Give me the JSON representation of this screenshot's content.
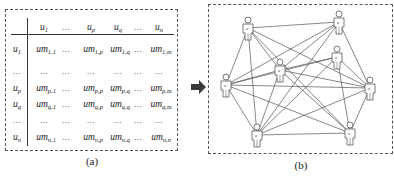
{
  "panel_a": {
    "caption": "(a)",
    "header": [
      {
        "base": "u",
        "sub": "1",
        "x": 44
      },
      {
        "dots": "…",
        "x": 66
      },
      {
        "base": "u",
        "sub": "p",
        "x": 91
      },
      {
        "base": "u",
        "sub": "q",
        "x": 118
      },
      {
        "dots": "…",
        "x": 138
      },
      {
        "base": "u",
        "sub": "n",
        "x": 159
      }
    ],
    "rows": [
      {
        "label": {
          "base": "u",
          "sub": "1"
        },
        "y": 49,
        "cells": [
          {
            "base": "um",
            "sub": "1,1"
          },
          {
            "dots": "…"
          },
          {
            "base": "um",
            "sub": "1,p"
          },
          {
            "base": "um",
            "sub": "1,q"
          },
          {
            "dots": "…"
          },
          {
            "base": "um",
            "sub": "1,m"
          }
        ]
      },
      {
        "label": {
          "dots": "…"
        },
        "y": 71,
        "cells": [
          {
            "dots": "…"
          },
          {
            "dots": "…"
          },
          {
            "dots": "…"
          },
          {
            "dots": "…"
          },
          {
            "dots": "…"
          },
          {
            "dots": "…"
          }
        ]
      },
      {
        "label": {
          "base": "u",
          "sub": "p"
        },
        "y": 88,
        "cells": [
          {
            "base": "um",
            "sub": "p,1"
          },
          {
            "dots": "…"
          },
          {
            "base": "um",
            "sub": "p,p"
          },
          {
            "base": "um",
            "sub": "p,q"
          },
          {
            "dots": "…"
          },
          {
            "base": "um",
            "sub": "p,m"
          }
        ]
      },
      {
        "label": {
          "base": "u",
          "sub": "q"
        },
        "y": 104,
        "cells": [
          {
            "base": "um",
            "sub": "q,1"
          },
          {
            "dots": "…"
          },
          {
            "base": "um",
            "sub": "q,p"
          },
          {
            "base": "um",
            "sub": "q,q"
          },
          {
            "dots": "…"
          },
          {
            "base": "um",
            "sub": "q,m"
          }
        ]
      },
      {
        "label": {
          "dots": "…"
        },
        "y": 120,
        "cells": [
          {
            "dots": "…"
          },
          {
            "dots": "…"
          },
          {
            "dots": "…"
          },
          {
            "dots": "…"
          },
          {
            "dots": "…"
          },
          {
            "dots": "…"
          }
        ]
      },
      {
        "label": {
          "base": "u",
          "sub": "n"
        },
        "y": 137,
        "cells": [
          {
            "base": "um",
            "sub": "n,1"
          },
          {
            "dots": "…"
          },
          {
            "base": "um",
            "sub": "n,p"
          },
          {
            "base": "um",
            "sub": "n,q"
          },
          {
            "dots": "…"
          },
          {
            "base": "um",
            "sub": "n,n"
          }
        ]
      }
    ],
    "label_x": 17
  },
  "arrow": {
    "color": "#3a3a3a"
  },
  "panel_b": {
    "caption": "(b)",
    "node_label": "u",
    "nodes": [
      {
        "id": "A",
        "x": 248,
        "y": 28
      },
      {
        "id": "B",
        "x": 339,
        "y": 22
      },
      {
        "id": "C",
        "x": 280,
        "y": 70
      },
      {
        "id": "D",
        "x": 337,
        "y": 57
      },
      {
        "id": "E",
        "x": 226,
        "y": 85
      },
      {
        "id": "F",
        "x": 370,
        "y": 88
      },
      {
        "id": "G",
        "x": 257,
        "y": 135
      },
      {
        "id": "H",
        "x": 350,
        "y": 133
      }
    ],
    "edges": [
      [
        "A",
        "B"
      ],
      [
        "A",
        "E"
      ],
      [
        "A",
        "G"
      ],
      [
        "A",
        "F"
      ],
      [
        "A",
        "H"
      ],
      [
        "A",
        "C"
      ],
      [
        "B",
        "E"
      ],
      [
        "B",
        "C"
      ],
      [
        "B",
        "F"
      ],
      [
        "B",
        "G"
      ],
      [
        "C",
        "D"
      ],
      [
        "C",
        "E"
      ],
      [
        "C",
        "F"
      ],
      [
        "C",
        "G"
      ],
      [
        "C",
        "H"
      ],
      [
        "D",
        "E"
      ],
      [
        "D",
        "F"
      ],
      [
        "D",
        "G"
      ],
      [
        "D",
        "H"
      ],
      [
        "E",
        "F"
      ],
      [
        "E",
        "G"
      ],
      [
        "E",
        "H"
      ],
      [
        "F",
        "G"
      ],
      [
        "F",
        "H"
      ],
      [
        "G",
        "H"
      ]
    ],
    "line_color": "#555555"
  }
}
